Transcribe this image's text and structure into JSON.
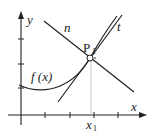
{
  "diagram": {
    "title": "",
    "axes": {
      "x_label": "x",
      "y_label": "y",
      "x_tick_label": "x",
      "x_tick_subscript": "1"
    },
    "labels": {
      "curve": "f (x)",
      "normal": "n",
      "tangent": "t",
      "point": "P",
      "point_subscript": "1"
    },
    "colors": {
      "line": "#222222",
      "guide": "#c8c8c8",
      "background": "#ffffff"
    }
  }
}
